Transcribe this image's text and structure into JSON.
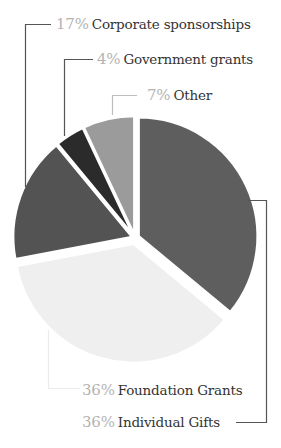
{
  "chart_data": {
    "type": "pie",
    "title": "",
    "slices": [
      {
        "label": "Individual Gifts",
        "value": 36,
        "pct_text": "36%",
        "color": "#5e5e5e"
      },
      {
        "label": "Foundation Grants",
        "value": 36,
        "pct_text": "36%",
        "color": "#efefef"
      },
      {
        "label": "Corporate sponsorships",
        "value": 17,
        "pct_text": "17%",
        "color": "#535353"
      },
      {
        "label": "Government grants",
        "value": 4,
        "pct_text": "4%",
        "color": "#2b2b2b"
      },
      {
        "label": "Other",
        "value": 7,
        "pct_text": "7%",
        "color": "#9b9b9b"
      }
    ],
    "start_angle": "north, clockwise",
    "legend_position": "callout labels with leader lines"
  },
  "labels": {
    "corporate": {
      "pct": "17%",
      "name": "Corporate sponsorships"
    },
    "government": {
      "pct": "4%",
      "name": "Government grants"
    },
    "other": {
      "pct": "7%",
      "name": "Other"
    },
    "foundation": {
      "pct": "36%",
      "name": "Foundation Grants"
    },
    "individual": {
      "pct": "36%",
      "name": "Individual Gifts"
    }
  },
  "colors": {
    "pct_text": "#b3b3b3",
    "label_text": "#333333",
    "leader_dark": "#555555",
    "leader_light": "#e4e4e4"
  }
}
